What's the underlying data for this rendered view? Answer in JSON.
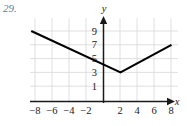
{
  "problem": {
    "number_label": "29.",
    "number_color": "#5b7f9e"
  },
  "axis_names": {
    "x": "x",
    "y": "y"
  },
  "colors": {
    "grid": "#d8d8d8",
    "axis": "#1a1a1a",
    "curve": "#000000",
    "background": "#ffffff",
    "label": "#1a1a1a"
  },
  "chart_data": {
    "type": "line",
    "title": "",
    "subtitle": "",
    "xlabel": "x",
    "ylabel": "y",
    "xlim": [
      -10,
      10
    ],
    "ylim": [
      -1,
      11
    ],
    "grid": true,
    "legend": null,
    "x_ticks": [
      -8,
      -6,
      -4,
      -2,
      2,
      4,
      6,
      8
    ],
    "x_tick_labels": [
      "−8",
      "−6",
      "−4",
      "−2",
      "2",
      "4",
      "6",
      "8"
    ],
    "y_ticks": [
      1,
      3,
      5,
      7,
      9
    ],
    "y_tick_labels": [
      "1",
      "3",
      "5",
      "7",
      "9"
    ],
    "grid_x": [
      -8,
      -6,
      -4,
      -2,
      0,
      2,
      4,
      6,
      8
    ],
    "grid_y": [
      1,
      3,
      5,
      7,
      9
    ],
    "series": [
      {
        "name": "absolute-value-graph",
        "type": "piecewise-linear",
        "points": [
          {
            "x": -8.5,
            "y": 9
          },
          {
            "x": 2,
            "y": 3
          },
          {
            "x": 8,
            "y": 7
          }
        ],
        "vertex": {
          "x": 2,
          "y": 3
        },
        "left_slope": -0.571,
        "right_slope": 0.667
      }
    ],
    "annotations": []
  }
}
